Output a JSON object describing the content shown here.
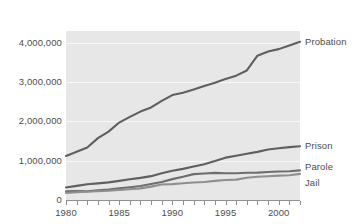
{
  "figure": {
    "title_fragment": "",
    "background": "#ffffff",
    "plot_background": "#e7e7e7",
    "gridline_color": "#f8f8f8",
    "axis_color": "#909090"
  },
  "chart_data": {
    "type": "line",
    "title": "",
    "xlabel": "",
    "ylabel": "",
    "xlim": [
      1980,
      2002
    ],
    "ylim": [
      0,
      4300000
    ],
    "grid": true,
    "legend_position": "right-of-lines",
    "x_tick_labels": [
      "1980",
      "1985",
      "1990",
      "1995",
      "2000"
    ],
    "x_tick_values": [
      1980,
      1985,
      1990,
      1995,
      2000
    ],
    "x_minor_ticks": [
      1980,
      1981,
      1982,
      1983,
      1984,
      1985,
      1986,
      1987,
      1988,
      1989,
      1990,
      1991,
      1992,
      1993,
      1994,
      1995,
      1996,
      1997,
      1998,
      1999,
      2000,
      2001,
      2002
    ],
    "y_tick_labels": [
      "4,000,000",
      "3,000,000",
      "2,000,000",
      "1,000,000",
      "0"
    ],
    "y_tick_values": [
      4000000,
      3000000,
      2000000,
      1000000,
      0
    ],
    "x": [
      1980,
      1981,
      1982,
      1983,
      1984,
      1985,
      1986,
      1987,
      1988,
      1989,
      1990,
      1991,
      1992,
      1993,
      1994,
      1995,
      1996,
      1997,
      1998,
      1999,
      2000,
      2001,
      2002
    ],
    "series": [
      {
        "name": "Probation",
        "label": "Probation",
        "color": "#5f5f5f",
        "values": [
          1120000,
          1225000,
          1335000,
          1575000,
          1740000,
          1970000,
          2115000,
          2250000,
          2356000,
          2522000,
          2670000,
          2729000,
          2811000,
          2903000,
          2981000,
          3078000,
          3164000,
          3296000,
          3671000,
          3779000,
          3839000,
          3932000,
          4024000
        ]
      },
      {
        "name": "Prison",
        "label": "Prison",
        "color": "#5f5f5f",
        "values": [
          320000,
          360000,
          402000,
          423000,
          448000,
          487000,
          526000,
          562000,
          607000,
          683000,
          743000,
          792000,
          850000,
          909000,
          990000,
          1078000,
          1127000,
          1177000,
          1224000,
          1287000,
          1316000,
          1345000,
          1367000
        ]
      },
      {
        "name": "Parole",
        "label": "Parole",
        "color": "#6e6e6e",
        "values": [
          220000,
          226000,
          224000,
          246000,
          266000,
          300000,
          325000,
          355000,
          408000,
          456000,
          531000,
          590000,
          658000,
          676000,
          690000,
          679000,
          680000,
          695000,
          696000,
          714000,
          725000,
          732000,
          753000
        ]
      },
      {
        "name": "Jail",
        "label": "Jail",
        "color": "#8f8f8f",
        "values": [
          182000,
          196000,
          209000,
          224000,
          234000,
          256000,
          274000,
          295000,
          341000,
          393000,
          405000,
          426000,
          445000,
          459000,
          486000,
          507000,
          518000,
          567000,
          592000,
          605000,
          621000,
          631000,
          665000
        ]
      }
    ]
  },
  "series_labels": {
    "probation": "Probation",
    "prison": "Prison",
    "parole": "Parole",
    "jail": "Jail"
  }
}
